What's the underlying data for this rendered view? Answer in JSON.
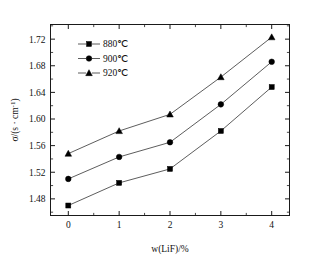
{
  "chart_data": {
    "type": "line",
    "title": "",
    "subtitle": "",
    "xlabel": "w(LiF)/%",
    "ylabel": "σ/(s · cm⁻¹)",
    "x": [
      0,
      1,
      2,
      3,
      4
    ],
    "categories": [
      "0",
      "1",
      "2",
      "3",
      "4"
    ],
    "xlim": [
      -0.35,
      4.35
    ],
    "ylim": [
      1.455,
      1.742
    ],
    "xticks": [
      "0",
      "1",
      "2",
      "3",
      "4"
    ],
    "yticks": [
      "1.48",
      "1.52",
      "1.56",
      "1.60",
      "1.64",
      "1.68",
      "1.72"
    ],
    "ytick_values": [
      1.48,
      1.52,
      1.56,
      1.6,
      1.64,
      1.68,
      1.72
    ],
    "grid": false,
    "legend_position": "upper-left",
    "minor_ticks": true,
    "series": [
      {
        "name": "880℃",
        "marker": "square",
        "color": "#000000",
        "values": [
          1.47,
          1.504,
          1.525,
          1.582,
          1.648
        ]
      },
      {
        "name": "900℃",
        "marker": "circle",
        "color": "#000000",
        "values": [
          1.51,
          1.543,
          1.565,
          1.622,
          1.686
        ]
      },
      {
        "name": "920℃",
        "marker": "triangle",
        "color": "#000000",
        "values": [
          1.548,
          1.582,
          1.607,
          1.663,
          1.723
        ]
      }
    ]
  },
  "axes": {
    "x_title": "w(LiF)/%",
    "y_title": "σ/(s · cm⁻¹)",
    "x_tick_labels": [
      "0",
      "1",
      "2",
      "3",
      "4"
    ],
    "y_tick_labels": [
      "1.48",
      "1.52",
      "1.56",
      "1.60",
      "1.64",
      "1.68",
      "1.72"
    ]
  },
  "legend": {
    "items": [
      {
        "label": "880℃",
        "marker": "square"
      },
      {
        "label": "900℃",
        "marker": "circle"
      },
      {
        "label": "920℃",
        "marker": "triangle"
      }
    ]
  },
  "colors": {
    "background": "#ffffff",
    "frame": "#1a1a1a",
    "line": "#333333",
    "marker": "#000000",
    "text": "#111111"
  }
}
